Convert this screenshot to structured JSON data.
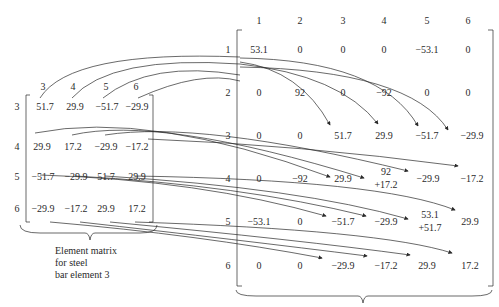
{
  "small_matrix": {
    "col_headers": [
      "3",
      "4",
      "5",
      "6"
    ],
    "row_headers": [
      "3",
      "4",
      "5",
      "6"
    ],
    "rows": [
      [
        "51.7",
        "29.9",
        "−51.7",
        "−29.9"
      ],
      [
        "29.9",
        "17.2",
        "−29.9",
        "−17.2"
      ],
      [
        "−51.7",
        "−29.9",
        "51.7",
        "29.9"
      ],
      [
        "−29.9",
        "−17.2",
        "29.9",
        "17.2"
      ]
    ],
    "caption": [
      "Element matrix",
      "for steel",
      "bar element 3"
    ]
  },
  "big_matrix": {
    "col_headers": [
      "1",
      "2",
      "3",
      "4",
      "5",
      "6"
    ],
    "row_headers": [
      "1",
      "2",
      "3",
      "4",
      "5",
      "6"
    ],
    "rows": [
      [
        "53.1",
        "0",
        "0",
        "0",
        "−53.1",
        "0"
      ],
      [
        "0",
        "92",
        "0",
        "−92",
        "0",
        "0"
      ],
      [
        "0",
        "0",
        "51.7",
        "29.9",
        "−51.7",
        "−29.9"
      ],
      [
        "0",
        "−92",
        "29.9",
        "92\n+17.2",
        "−29.9",
        "−17.2"
      ],
      [
        "−53.1",
        "0",
        "−51.7",
        "−29.9",
        "53.1\n+51.7",
        "29.9"
      ],
      [
        "0",
        "0",
        "−29.9",
        "−17.2",
        "29.9",
        "17.2"
      ]
    ],
    "cell_split": {
      "r3c3": [
        "92",
        "+17.2"
      ],
      "r4c4": [
        "53.1",
        "+51.7"
      ]
    }
  },
  "colors": {
    "ink": "#2a2a2a",
    "background": "#ffffff"
  }
}
